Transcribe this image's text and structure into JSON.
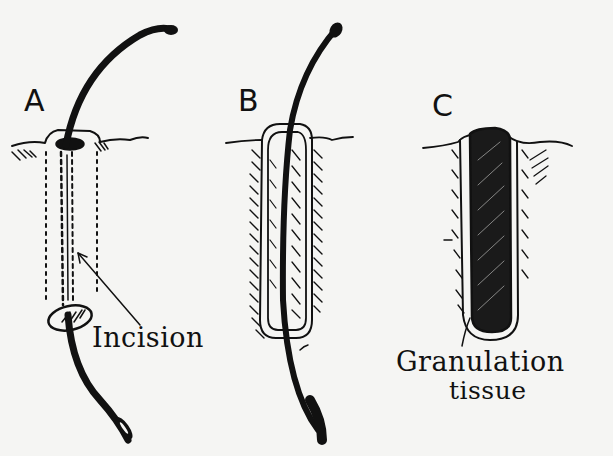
{
  "figure": {
    "panels": [
      {
        "id": "A",
        "label": "A",
        "caption": "Incision"
      },
      {
        "id": "B",
        "label": "B"
      },
      {
        "id": "C",
        "label": "C",
        "caption_line1": "Granulation",
        "caption_line2": "tissue"
      }
    ],
    "colors": {
      "ink": "#111111",
      "paper": "#f5f5f3"
    }
  }
}
